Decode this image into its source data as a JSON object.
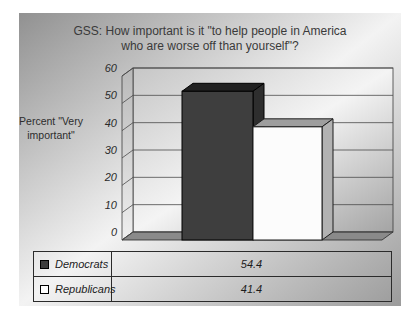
{
  "chart_title": {
    "line1": "GSS: How important is it \"to help people in America",
    "line2": "who are worse off than yourself\"?"
  },
  "y_axis_title": {
    "line1": "Percent \"Very",
    "line2": "important\""
  },
  "chart_data": {
    "type": "bar",
    "style": "3d-column",
    "title": "GSS: How important is it \"to help people in America who are worse off than yourself\"?",
    "ylabel": "Percent \"Very important\"",
    "xlabel": "",
    "categories": [
      "Democrats",
      "Republicans"
    ],
    "values": [
      54.4,
      41.4
    ],
    "value_labels": [
      "54.4",
      "41.4"
    ],
    "ylim": [
      0,
      60
    ],
    "yticks": [
      0,
      10,
      20,
      30,
      40,
      50,
      60
    ],
    "grid": true,
    "legend_position": "data-table-below",
    "series_colors": [
      "#3e3e3e",
      "#fcfcfc"
    ]
  },
  "data_table": {
    "rows": [
      {
        "label": "Democrats",
        "value": "54.4",
        "swatch_fill": "#3e3e3e"
      },
      {
        "label": "Republicans",
        "value": "41.4",
        "swatch_fill": "#ffffff"
      }
    ]
  },
  "colors": {
    "background_dark": "#919191",
    "background_light": "#f3f3f3",
    "gridline": "#4a4a4a",
    "floor": "#8a8a8a",
    "tick_text": "#2b2b2b",
    "title_text": "#3a3a3a",
    "bar_democrats_front": "#3e3e3e",
    "bar_democrats_top": "#212121",
    "bar_democrats_side": "#2e2e2e",
    "bar_republicans_front": "#fcfcfc",
    "bar_republicans_top": "#9e9e9e",
    "bar_republicans_side": "#b2b2b2"
  }
}
